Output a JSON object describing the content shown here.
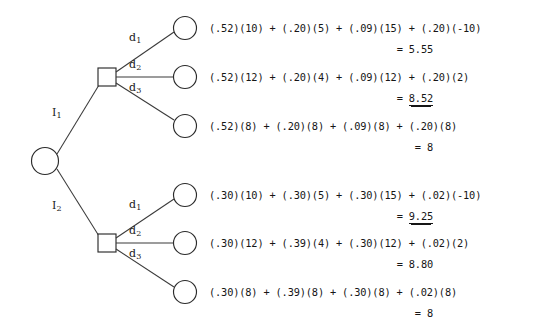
{
  "diagram": {
    "root": {
      "type": "chance-node",
      "shape": "circle"
    },
    "information_branches": [
      {
        "id": "I1",
        "label": "I",
        "subscript": "1"
      },
      {
        "id": "I2",
        "label": "I",
        "subscript": "2"
      }
    ],
    "decision_branches": [
      {
        "id": "d1",
        "label": "d",
        "subscript": "1"
      },
      {
        "id": "d2",
        "label": "d",
        "subscript": "2"
      },
      {
        "id": "d3",
        "label": "d",
        "subscript": "3"
      }
    ],
    "upper_subtree": {
      "information_label": "I",
      "information_subscript": "1",
      "outcomes": [
        {
          "decision": "d1",
          "expression": "(.52)(10) + (.20)(5) + (.09)(15) + (.20)(-10)",
          "equals": "=",
          "value": "5.55",
          "optimal": false
        },
        {
          "decision": "d2",
          "expression": "(.52)(12) + (.20)(4) + (.09)(12) + (.20)(2)",
          "equals": "=",
          "value": "8.52",
          "optimal": true
        },
        {
          "decision": "d3",
          "expression": "(.52)(8) + (.20)(8) + (.09)(8) + (.20)(8)",
          "equals": "=",
          "value": "8",
          "optimal": false
        }
      ]
    },
    "lower_subtree": {
      "information_label": "I",
      "information_subscript": "2",
      "outcomes": [
        {
          "decision": "d1",
          "expression": "(.30)(10) + (.30)(5) + (.30)(15) + (.02)(-10)",
          "equals": "=",
          "value": "9.25",
          "optimal": true
        },
        {
          "decision": "d2",
          "expression": "(.30)(12) + (.39)(4) + (.30)(12) + (.02)(2)",
          "equals": "=",
          "value": "8.80",
          "optimal": false
        },
        {
          "decision": "d3",
          "expression": "(.30)(8) + (.39)(8) + (.30)(8) + (.02)(8)",
          "equals": "=",
          "value": "8",
          "optimal": false
        }
      ]
    },
    "colors": {
      "background": "#ffffff",
      "stroke": "#2b2b2b",
      "text": "#161616"
    }
  }
}
